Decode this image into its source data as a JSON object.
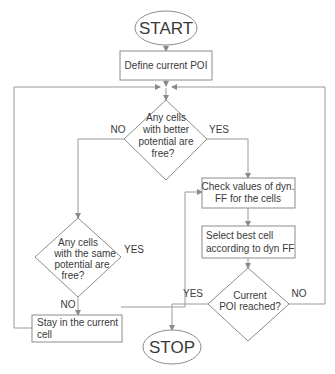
{
  "diagram": {
    "type": "flowchart",
    "nodes": {
      "start": {
        "label": "START",
        "shape": "oval"
      },
      "define_poi": {
        "label": "Define current POI",
        "shape": "box"
      },
      "decision_better": {
        "lines": [
          "Any cells",
          "with better",
          "potential are",
          "free?"
        ],
        "shape": "diamond"
      },
      "check_ff": {
        "lines": [
          "Check values of dyn.",
          "FF for the cells"
        ],
        "shape": "box"
      },
      "select_best": {
        "lines": [
          "Select best cell",
          "according to dyn FF"
        ],
        "shape": "box"
      },
      "decision_same": {
        "lines": [
          "Any cells",
          "with the same",
          "potential are",
          "free?"
        ],
        "shape": "diamond"
      },
      "decision_reached": {
        "lines": [
          "Current",
          "POI reached?"
        ],
        "shape": "diamond"
      },
      "stay": {
        "lines": [
          "Stay in the current",
          "cell"
        ],
        "shape": "box"
      },
      "stop": {
        "label": "STOP",
        "shape": "oval"
      }
    },
    "edge_labels": {
      "better_no": "NO",
      "better_yes": "YES",
      "same_yes": "YES",
      "same_no": "NO",
      "reached_yes": "YES",
      "reached_no": "NO"
    },
    "edges": [
      {
        "from": "start",
        "to": "define_poi"
      },
      {
        "from": "define_poi",
        "to": "decision_better"
      },
      {
        "from": "decision_better",
        "to": "decision_same",
        "label": "NO"
      },
      {
        "from": "decision_better",
        "to": "check_ff",
        "label": "YES"
      },
      {
        "from": "decision_same",
        "to": "check_ff",
        "label": "YES"
      },
      {
        "from": "decision_same",
        "to": "stay",
        "label": "NO"
      },
      {
        "from": "check_ff",
        "to": "select_best"
      },
      {
        "from": "select_best",
        "to": "decision_reached"
      },
      {
        "from": "decision_reached",
        "to": "stop",
        "label": "YES"
      },
      {
        "from": "decision_reached",
        "to": "decision_better",
        "label": "NO"
      },
      {
        "from": "stay",
        "to": "decision_better"
      }
    ],
    "colors": {
      "line": "#9a9a9a",
      "text": "#3a3a3a",
      "background": "#ffffff"
    }
  }
}
